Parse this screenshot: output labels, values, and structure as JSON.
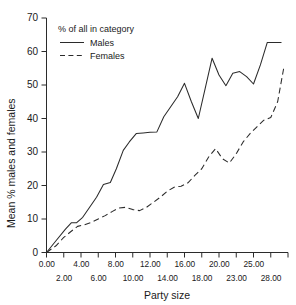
{
  "chart_data": {
    "type": "line",
    "title": "",
    "xlabel": "Party size",
    "ylabel": "Mean % males and females",
    "legend_title": "% of all in category",
    "legend_position": "top-left-inside",
    "grid": false,
    "xlim": [
      0,
      14
    ],
    "ylim": [
      0,
      70
    ],
    "yticks": [
      0,
      10,
      20,
      30,
      40,
      50,
      60,
      70
    ],
    "xticks_top": [
      "0.00",
      "4.00",
      "8.00",
      "12.00",
      "16.00",
      "20.00",
      "25.00"
    ],
    "xticks_bottom": [
      "2.00",
      "6.00",
      "10.00",
      "14.00",
      "18.00",
      "23.00",
      "28.00"
    ],
    "categories": [
      "0.00",
      "2.00",
      "4.00",
      "6.00",
      "8.00",
      "10.00",
      "12.00",
      "14.00",
      "16.00",
      "18.00",
      "20.00",
      "23.00",
      "25.00",
      "28.00"
    ],
    "series": [
      {
        "name": "Males",
        "style": "solid",
        "color": "#2b2b2b",
        "x": [
          0.0,
          0.55,
          1.1,
          1.45,
          1.75,
          2.1,
          2.5,
          2.9,
          3.3,
          3.7,
          4.05,
          4.45,
          4.8,
          5.2,
          5.6,
          6.0,
          6.4,
          6.8,
          7.2,
          7.6,
          8.0,
          8.4,
          8.8,
          9.2,
          9.6,
          10.0,
          10.4,
          10.8,
          11.2,
          11.6,
          12.0,
          12.4,
          12.8,
          13.2,
          13.6
        ],
        "values": [
          0.0,
          3.5,
          7.0,
          8.9,
          8.9,
          10.5,
          13.5,
          16.5,
          20.3,
          20.9,
          25.0,
          30.5,
          33.0,
          35.5,
          35.7,
          35.9,
          36.0,
          40.5,
          43.5,
          46.5,
          50.5,
          45.0,
          40.0,
          49.0,
          58.0,
          53.0,
          49.8,
          53.5,
          54.0,
          52.5,
          50.3,
          56.0,
          62.7,
          62.7,
          62.7
        ]
      },
      {
        "name": "Females",
        "style": "dashed",
        "color": "#2b2b2b",
        "x": [
          0.0,
          0.55,
          1.0,
          1.4,
          1.8,
          2.2,
          2.6,
          3.0,
          3.4,
          3.8,
          4.2,
          4.6,
          5.0,
          5.4,
          5.8,
          6.2,
          6.6,
          7.0,
          7.4,
          7.8,
          8.2,
          8.6,
          9.0,
          9.4,
          9.8,
          10.2,
          10.6,
          11.0,
          11.4,
          11.8,
          12.2,
          12.6,
          13.0,
          13.4,
          13.75
        ],
        "values": [
          0.0,
          2.0,
          4.5,
          6.2,
          7.8,
          8.3,
          9.0,
          10.0,
          11.0,
          12.2,
          13.3,
          13.5,
          12.8,
          12.5,
          13.5,
          15.0,
          16.5,
          18.3,
          19.5,
          19.8,
          20.8,
          23.0,
          25.0,
          28.5,
          31.0,
          28.0,
          26.7,
          29.5,
          33.0,
          35.5,
          37.5,
          39.5,
          40.3,
          45.0,
          55.0
        ]
      }
    ]
  }
}
